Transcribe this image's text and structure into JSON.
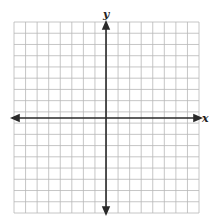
{
  "chart_data": {
    "type": "coordinate-grid",
    "title": "",
    "xlabel": "x",
    "ylabel": "y",
    "grid": true,
    "columns": 16,
    "rows": 17,
    "axes_arrows": "both-ends",
    "tick_labels": []
  },
  "labels": {
    "x_axis": "x",
    "y_axis": "y"
  },
  "colors": {
    "grid": "#b8b8b8",
    "axis": "#2a2a2a",
    "background": "#ffffff"
  }
}
